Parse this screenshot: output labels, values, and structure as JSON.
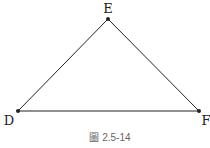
{
  "diagram": {
    "type": "triangle",
    "points": {
      "E": {
        "x": 108,
        "y": 19
      },
      "D": {
        "x": 18,
        "y": 111
      },
      "F": {
        "x": 199,
        "y": 111
      }
    },
    "labels": {
      "E": "E",
      "D": "D",
      "F": "F"
    },
    "edges": [
      [
        "D",
        "E"
      ],
      [
        "E",
        "F"
      ],
      [
        "D",
        "F"
      ]
    ],
    "line_color": "#222222"
  },
  "caption": "圖 2.5-14"
}
